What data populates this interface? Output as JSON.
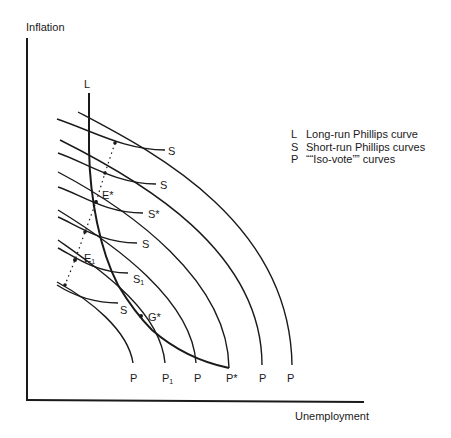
{
  "axes": {
    "y_label": "Inflation",
    "x_label": "Unemployment"
  },
  "legend": [
    {
      "key": "L",
      "text": "Long-run Phillips curve"
    },
    {
      "key": "S",
      "text": "Short-run Phillips curves"
    },
    {
      "key": "P",
      "text": "““Iso-vote”” curves"
    }
  ],
  "labels": {
    "L": "L",
    "E_star": "E*",
    "E_1_main": "E",
    "E_1_sub": "1",
    "G_star": "G*",
    "S_curves": [
      {
        "main": "S",
        "sub": ""
      },
      {
        "main": "S",
        "sub": ""
      },
      {
        "main": "S*",
        "sub": ""
      },
      {
        "main": "S",
        "sub": ""
      },
      {
        "main": "S",
        "sub": "1"
      },
      {
        "main": "S",
        "sub": ""
      }
    ],
    "P_curves": [
      {
        "main": "P",
        "sub": ""
      },
      {
        "main": "P",
        "sub": "1"
      },
      {
        "main": "P",
        "sub": ""
      },
      {
        "main": "P*",
        "sub": ""
      },
      {
        "main": "P",
        "sub": ""
      },
      {
        "main": "P",
        "sub": ""
      }
    ]
  },
  "colors": {
    "ink": "#1a1a1a",
    "background": "#ffffff"
  }
}
